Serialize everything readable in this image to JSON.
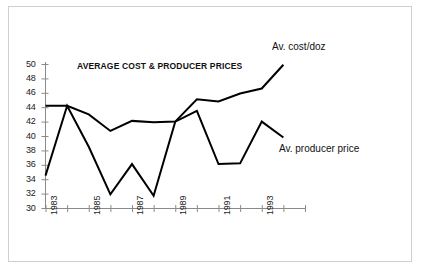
{
  "figure": {
    "frame_border_color": "#cfcfcf",
    "background": "#ffffff"
  },
  "chart_data": {
    "type": "line",
    "title": "AVERAGE COST & PRODUCER PRICES",
    "xlabel": "",
    "ylabel": "",
    "ylim": [
      30,
      50
    ],
    "ytick_step": 2,
    "yticks": [
      30,
      32,
      34,
      36,
      38,
      40,
      42,
      44,
      46,
      48,
      50
    ],
    "xlim": [
      1983,
      1995
    ],
    "x": [
      1983,
      1984,
      1985,
      1986,
      1987,
      1988,
      1989,
      1990,
      1991,
      1992,
      1993,
      1994
    ],
    "xticks": [
      1983,
      1984,
      1985,
      1986,
      1987,
      1988,
      1989,
      1990,
      1991,
      1992,
      1993,
      1994,
      1995
    ],
    "xticklabels": [
      "1983",
      "",
      "1985",
      "",
      "1987",
      "",
      "1989",
      "",
      "1991",
      "",
      "1993",
      "",
      ""
    ],
    "xticklabel_rotation": 90,
    "grid": false,
    "legend": "annotations-inline",
    "line_color": "#000000",
    "series": [
      {
        "name": "Av. cost/doz",
        "annotation": "Av. cost/doz",
        "values": [
          44.2,
          44.2,
          43.0,
          40.7,
          42.1,
          41.9,
          42.0,
          45.1,
          44.8,
          45.9,
          46.6,
          49.9
        ]
      },
      {
        "name": "Av. producer price",
        "annotation": "Av. producer price",
        "values": [
          34.5,
          44.2,
          38.5,
          31.9,
          36.1,
          31.7,
          42.0,
          43.5,
          36.1,
          36.2,
          42.0,
          39.8
        ]
      }
    ]
  }
}
